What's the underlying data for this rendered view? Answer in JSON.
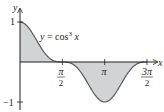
{
  "chart_data": {
    "type": "area",
    "title": "",
    "function_label": "y = cos³ x",
    "function_label_parts": {
      "lhs": "y",
      "eq": " = cos",
      "exp": "3",
      "var": " x"
    },
    "xlabel": "x",
    "ylabel": "y",
    "xlim": [
      0,
      4.9
    ],
    "ylim": [
      -1.05,
      1.05
    ],
    "x_ticks": [
      {
        "value": 1.5708,
        "num": "π",
        "den": "2"
      },
      {
        "value": 3.1416,
        "num": "π",
        "den": ""
      },
      {
        "value": 4.7124,
        "num": "3π",
        "den": "2"
      }
    ],
    "y_ticks": [
      {
        "value": 1,
        "label": "1"
      },
      {
        "value": -1,
        "label": "−1"
      }
    ],
    "x": [
      0,
      0.3927,
      0.7854,
      1.1781,
      1.5708,
      1.9635,
      2.3562,
      2.7489,
      3.1416,
      3.5343,
      3.927,
      4.3197,
      4.7124
    ],
    "values": [
      1,
      0.789,
      0.354,
      0.056,
      0,
      -0.056,
      -0.354,
      -0.789,
      -1,
      -0.789,
      -0.354,
      -0.056,
      0
    ],
    "fill_color": "#d1d3d4",
    "line_color": "#58595b",
    "axis_color": "#231f20",
    "grid": false,
    "legend": null
  }
}
